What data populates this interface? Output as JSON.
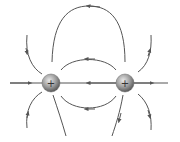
{
  "diagram": {
    "line_color": "#555555",
    "charges": [
      {
        "id": "left",
        "sign": "+",
        "cx": 51,
        "cy": 83,
        "r": 9
      },
      {
        "id": "right",
        "sign": "+",
        "cx": 125,
        "cy": 83,
        "r": 9
      }
    ]
  }
}
